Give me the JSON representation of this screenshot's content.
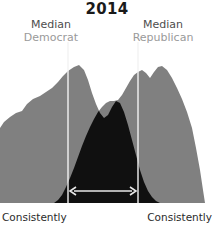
{
  "chart_title": "2014",
  "annotations": {
    "median_democrat": {
      "median_word": "Median",
      "party_word": "Democrat"
    },
    "median_republican": {
      "median_word": "Median",
      "party_word": "Republican"
    },
    "axis_left": "Consistently",
    "axis_right": "Consistently"
  },
  "colors": {
    "distribution_gray": "#808080",
    "overlap_dark": "#101010",
    "median_line": "#f2f2f2",
    "arrow": "#e8e8e8",
    "title_text": "#1a1a1a",
    "median_text": "#4d4d4d",
    "party_text": "#9a9a9a",
    "axis_text": "#2b2b2b",
    "background": "#ffffff"
  },
  "chart_data": {
    "type": "area",
    "title": "2014",
    "xlabel": "",
    "ylabel": "",
    "xlim": [
      0,
      214
    ],
    "ylim": [
      0,
      203
    ],
    "grid": false,
    "legend": "none",
    "series": [
      {
        "name": "Democrat distribution",
        "color": "#808080",
        "median_x": 68,
        "peak_x": 78,
        "peak_y": 68,
        "points": [
          [
            0,
            203
          ],
          [
            0,
            128
          ],
          [
            4,
            122
          ],
          [
            10,
            117
          ],
          [
            16,
            113
          ],
          [
            22,
            111
          ],
          [
            27,
            104
          ],
          [
            33,
            99
          ],
          [
            40,
            96
          ],
          [
            46,
            92
          ],
          [
            52,
            88
          ],
          [
            58,
            82
          ],
          [
            63,
            76
          ],
          [
            68,
            71
          ],
          [
            74,
            67
          ],
          [
            79,
            65
          ],
          [
            84,
            70
          ],
          [
            88,
            80
          ],
          [
            92,
            93
          ],
          [
            96,
            104
          ],
          [
            100,
            113
          ],
          [
            104,
            118
          ],
          [
            108,
            115
          ],
          [
            112,
            107
          ],
          [
            116,
            101
          ],
          [
            120,
            103
          ],
          [
            124,
            112
          ],
          [
            128,
            125
          ],
          [
            132,
            140
          ],
          [
            136,
            155
          ],
          [
            140,
            170
          ],
          [
            144,
            182
          ],
          [
            148,
            191
          ],
          [
            152,
            197
          ],
          [
            156,
            201
          ],
          [
            160,
            203
          ]
        ]
      },
      {
        "name": "Republican distribution",
        "color": "#808080",
        "median_x": 138,
        "peak_x": 162,
        "peak_y": 66,
        "points": [
          [
            54,
            203
          ],
          [
            58,
            200
          ],
          [
            62,
            195
          ],
          [
            66,
            187
          ],
          [
            70,
            178
          ],
          [
            74,
            168
          ],
          [
            78,
            157
          ],
          [
            82,
            146
          ],
          [
            86,
            136
          ],
          [
            90,
            127
          ],
          [
            94,
            119
          ],
          [
            98,
            112
          ],
          [
            102,
            107
          ],
          [
            106,
            103
          ],
          [
            110,
            101
          ],
          [
            114,
            101
          ],
          [
            118,
            100
          ],
          [
            122,
            95
          ],
          [
            126,
            88
          ],
          [
            130,
            81
          ],
          [
            134,
            75
          ],
          [
            138,
            72
          ],
          [
            142,
            70
          ],
          [
            146,
            73
          ],
          [
            150,
            78
          ],
          [
            154,
            72
          ],
          [
            158,
            67
          ],
          [
            162,
            66
          ],
          [
            167,
            70
          ],
          [
            172,
            78
          ],
          [
            177,
            88
          ],
          [
            182,
            99
          ],
          [
            187,
            112
          ],
          [
            192,
            128
          ],
          [
            196,
            148
          ],
          [
            200,
            170
          ],
          [
            203,
            190
          ],
          [
            205,
            203
          ]
        ]
      },
      {
        "name": "Overlap region",
        "color": "#101010",
        "note": "Intersection of the two distributions rendered in near-black"
      }
    ],
    "markers": {
      "median_lines": [
        {
          "label": "Median Democrat",
          "x": 68,
          "y_top": 42,
          "y_bottom": 203
        },
        {
          "label": "Median Republican",
          "x": 138,
          "y_top": 42,
          "y_bottom": 203
        }
      ],
      "gap_arrow": {
        "label": "median gap",
        "x_start": 70,
        "x_end": 136,
        "y": 191,
        "double_headed": true
      }
    }
  }
}
